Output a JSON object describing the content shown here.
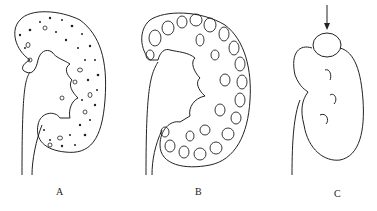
{
  "figure": {
    "panels": [
      {
        "id": "A",
        "label": "A",
        "description": "kidney with many small cysts / dots"
      },
      {
        "id": "B",
        "label": "B",
        "description": "kidney with many large cysts"
      },
      {
        "id": "C",
        "label": "C",
        "description": "kidney with single upper-pole cyst indicated by arrow"
      }
    ],
    "colors": {
      "stroke": "#222222",
      "background": "#ffffff"
    }
  }
}
